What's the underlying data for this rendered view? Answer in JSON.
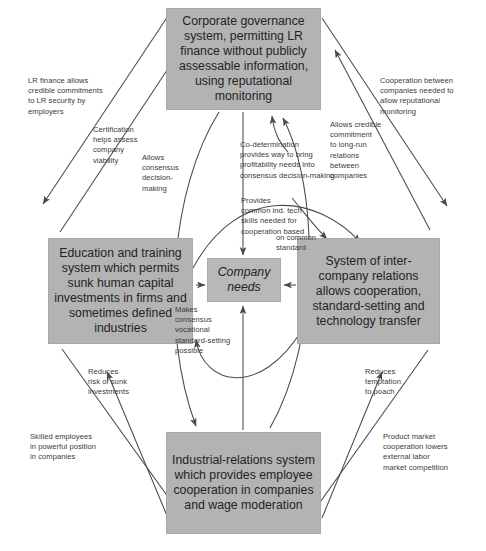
{
  "diagram": {
    "box_fill": "#b3b3b3",
    "line_color": "#4a4a4a"
  },
  "nodes": {
    "corporate_governance": "Corporate governance system, permitting LR finance without publicly assessable information, using reputational monitoring",
    "education_training": "Education and training system which permits sunk human capital investments in firms and sometimes defined industries",
    "inter_company": "System of inter-company relations allows cooperation, standard-setting and technology transfer",
    "industrial_relations": "Industrial-relations system which provides employee cooperation in companies and wage moderation",
    "center": "Company needs"
  },
  "labels": {
    "lr_finance": "LR finance allows\ncredible commitments\nto LR security by\nemployers",
    "certification": "Certification\nhelps assess\ncompany\nviability",
    "allows_consensus": "Allows\nconsensus\ndecision-\nmaking",
    "co_determination": "Co-determination\nprovides way to bring\nprofitability needs into\nconsensus decision-making",
    "cooperation_between": "Cooperation between\ncompanies needed to\nallow reputational\nmonitoring",
    "allows_credible": "Allows credible\ncommitment\nto long-run\nrelations\nbetween\ncompanies",
    "provides_common": "Provides\ncommon ind. tech\nskills needed for\ncooperation based",
    "on_common_standard": "on  common\nstandard",
    "makes_consensus": "Makes\nconsensus\nvocational\nstandard-setting\npossible",
    "reduces_risk": "Reduces\nrisk of sunk\ninvestments",
    "skilled_employees": "Skilled employees\nin powerful position\nin companies",
    "reduces_temptation": "Reduces\ntemptation\nto poach",
    "product_market": "Product market\ncooperation lowers\nexternal labor\nmarket competition"
  }
}
